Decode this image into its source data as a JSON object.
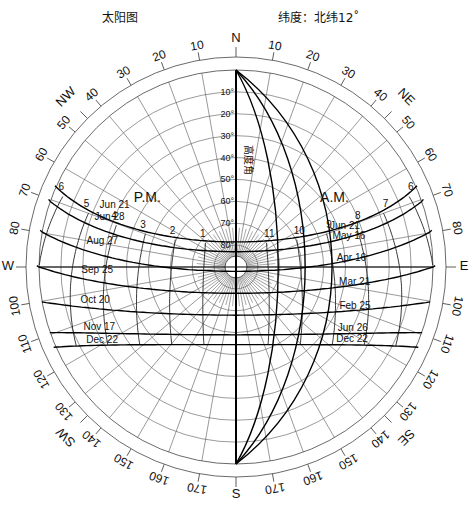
{
  "header": {
    "title": "太阳图",
    "latitude_label": "纬度：北纬12˚"
  },
  "chart_data": {
    "type": "sun-path-diagram",
    "title": "太阳图",
    "latitude": "北纬12°",
    "center": [
      236,
      267
    ],
    "outer_radius": 210,
    "inner_radius": 197,
    "altitude_axis_label": "高度角",
    "altitude_ticks": [
      "10°",
      "20°",
      "30°",
      "40°",
      "50°",
      "60°",
      "70°",
      "80°"
    ],
    "compass_labels": [
      {
        "az": 0,
        "text": "N"
      },
      {
        "az": 45,
        "text": "NE"
      },
      {
        "az": 90,
        "text": "E"
      },
      {
        "az": 135,
        "text": "SE"
      },
      {
        "az": 180,
        "text": "S"
      },
      {
        "az": 225,
        "text": "SW"
      },
      {
        "az": 270,
        "text": "W"
      },
      {
        "az": 315,
        "text": "NW"
      }
    ],
    "azimuth_labels_east": [
      "10",
      "20",
      "30",
      "40",
      "50",
      "60",
      "70",
      "80",
      "100",
      "110",
      "120",
      "130",
      "140",
      "150",
      "160",
      "170"
    ],
    "azimuth_labels_west": [
      "10",
      "20",
      "30",
      "40",
      "50",
      "60",
      "70",
      "80",
      "100",
      "110",
      "120",
      "130",
      "140",
      "150",
      "160",
      "170"
    ],
    "period_labels": {
      "pm": "P.M.",
      "am": "A.M."
    },
    "date_lines": [
      {
        "label": "Jun 21",
        "pm_label": "Jun 21",
        "am_label": "Jun 21",
        "dec": 23.45
      },
      {
        "label": "May 16 / Jun 28",
        "pm_label": "Jun 28",
        "am_label": "May 16",
        "dec": 19
      },
      {
        "label": "Apr 16 / Aug 27",
        "pm_label": "Aug 27",
        "am_label": "Apr 16",
        "dec": 10
      },
      {
        "label": "Mar 21 / Sep 25",
        "pm_label": "Sep 25",
        "am_label": "Mar 21",
        "dec": 0
      },
      {
        "label": "Feb 25 / Oct 20",
        "pm_label": "Oct 20",
        "am_label": "Feb 25",
        "dec": -10
      },
      {
        "label": "Jun 26 / Nov 17",
        "pm_label": "Nov 17",
        "am_label": "Jun 26",
        "dec": -19
      },
      {
        "label": "Dec 22",
        "pm_label": "Dec 22",
        "am_label": "Dec 22",
        "dec": -23.45
      }
    ],
    "hour_labels_pm": [
      "1",
      "2",
      "3",
      "4",
      "5",
      "6"
    ],
    "hour_labels_am": [
      "11",
      "10",
      "9",
      "8",
      "7",
      "6"
    ]
  }
}
